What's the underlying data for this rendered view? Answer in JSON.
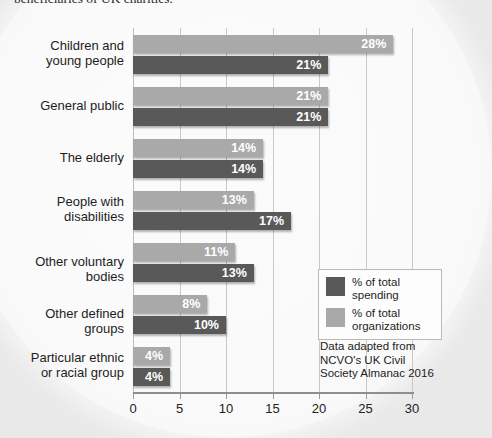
{
  "caption": "beneficiaries of UK charities.",
  "colors": {
    "spending": "#595959",
    "organizations": "#a9a9a9",
    "background": "#e9e9ea",
    "panel": "#fafafa",
    "gridline": "#c9c9c9",
    "value_label": "#ffffff"
  },
  "legend": {
    "position": "bottom-right",
    "items": [
      {
        "label": "% of total\nspending",
        "color": "#595959",
        "key": "spending"
      },
      {
        "label": "% of total\norganizations",
        "color": "#a9a9a9",
        "key": "organizations"
      }
    ]
  },
  "source_note": "Data adapted from\nNCVO's UK Civil\nSociety Almanac 2016",
  "chart_data": {
    "type": "bar",
    "orientation": "horizontal",
    "title": "",
    "subtitle": "",
    "xlabel": "",
    "ylabel": "",
    "xlim": [
      0,
      30
    ],
    "xticks": [
      0,
      5,
      10,
      15,
      20,
      25,
      30
    ],
    "xtick_labels": [
      "0",
      "5",
      "10",
      "15",
      "20",
      "25",
      "30"
    ],
    "grid": true,
    "grid_axis": "x",
    "value_label_suffix": "%",
    "categories": [
      "Children and\nyoung people",
      "General public",
      "The elderly",
      "People with\ndisabilities",
      "Other voluntary bodies",
      "Other defined groups",
      "Particular ethnic\nor racial group"
    ],
    "series": [
      {
        "name": "% of total organizations",
        "color": "#a9a9a9",
        "values": [
          28,
          21,
          14,
          13,
          11,
          8,
          4
        ],
        "value_labels": [
          "28%",
          "21%",
          "14%",
          "13%",
          "11%",
          "8%",
          "4%"
        ]
      },
      {
        "name": "% of total spending",
        "color": "#595959",
        "values": [
          21,
          21,
          14,
          17,
          13,
          10,
          4
        ],
        "value_labels": [
          "21%",
          "21%",
          "14%",
          "17%",
          "13%",
          "10%",
          "4%"
        ]
      }
    ]
  }
}
